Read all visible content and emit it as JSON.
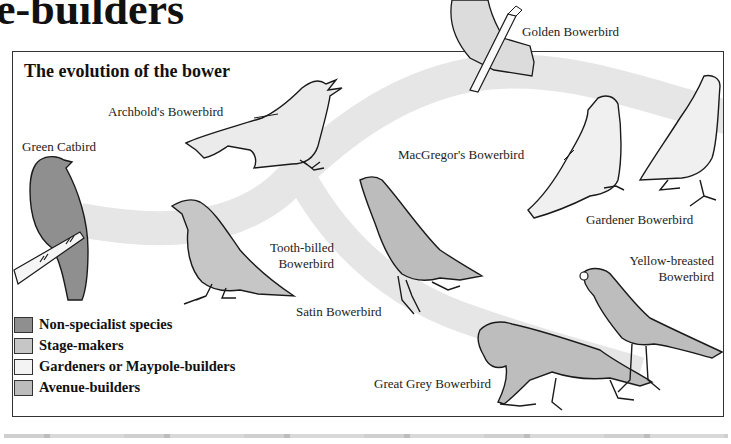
{
  "page": {
    "title": "e-builders"
  },
  "diagram": {
    "title": "The evolution of the bower",
    "colors": {
      "non_specialist": "#8f8f8f",
      "stage_makers": "#c4c4c4",
      "gardeners": "#f2f2f2",
      "avenue_builders": "#bdbdbd",
      "evolution_band": "#e4e4e4",
      "outline": "#1a1a1a"
    },
    "birds": [
      {
        "id": "green-catbird",
        "label": "Green Catbird",
        "group": "Non-specialist species"
      },
      {
        "id": "archbolds-bowerbird",
        "label": "Archbold's Bowerbird",
        "group": "Gardeners or Maypole-builders"
      },
      {
        "id": "golden-bowerbird",
        "label": "Golden Bowerbird",
        "group": "Gardeners or Maypole-builders"
      },
      {
        "id": "tooth-billed-bowerbird",
        "label_line1": "Tooth-billed",
        "label_line2": "Bowerbird",
        "group": "Stage-makers"
      },
      {
        "id": "macgregors-bowerbird",
        "label": "MacGregor's Bowerbird",
        "group": "Gardeners or Maypole-builders"
      },
      {
        "id": "gardener-bowerbird",
        "label": "Gardener Bowerbird",
        "group": "Gardeners or Maypole-builders"
      },
      {
        "id": "satin-bowerbird",
        "label": "Satin Bowerbird",
        "group": "Avenue-builders"
      },
      {
        "id": "yellow-breasted-bowerbird",
        "label_line1": "Yellow-breasted",
        "label_line2": "Bowerbird",
        "group": "Avenue-builders"
      },
      {
        "id": "great-grey-bowerbird",
        "label": "Great Grey Bowerbird",
        "group": "Avenue-builders"
      }
    ],
    "legend": [
      {
        "label": "Non-specialist species",
        "color": "#8f8f8f"
      },
      {
        "label": "Stage-makers",
        "color": "#c6c6c6"
      },
      {
        "label": "Gardeners or Maypole-builders",
        "color": "#f3f3f3"
      },
      {
        "label": "Avenue-builders",
        "color": "#bcbcbc"
      }
    ]
  }
}
